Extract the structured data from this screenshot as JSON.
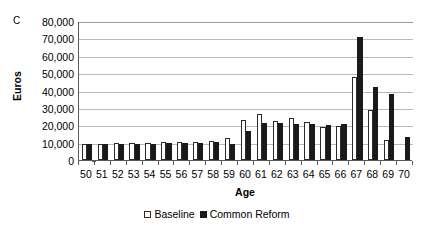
{
  "panel": {
    "letter": "C"
  },
  "legend": {
    "position": "bottom-center",
    "items": [
      {
        "label": "Baseline",
        "swatch": "open-square",
        "color": "#ffffff"
      },
      {
        "label": "Common Reform",
        "swatch": "filled-square",
        "color": "#1a1a1a"
      }
    ]
  },
  "chart_data": {
    "type": "bar",
    "title": "",
    "subtitle": "",
    "xlabel": "Age",
    "ylabel": "Euros",
    "ylim": [
      0,
      80000
    ],
    "ytick_labels": [
      "80,000",
      "70,000",
      "60,000",
      "50,000",
      "40,000",
      "30,000",
      "20,000",
      "10,000",
      "0"
    ],
    "ytick_values": [
      80000,
      70000,
      60000,
      50000,
      40000,
      30000,
      20000,
      10000,
      0
    ],
    "grid": "horizontal",
    "categories": [
      "50",
      "51",
      "52",
      "53",
      "54",
      "55",
      "56",
      "57",
      "58",
      "59",
      "60",
      "61",
      "62",
      "63",
      "64",
      "65",
      "66",
      "67",
      "68",
      "69",
      "70"
    ],
    "series": [
      {
        "name": "Baseline",
        "color": "#ffffff",
        "values": [
          9500,
          9500,
          9700,
          9800,
          10000,
          10200,
          10400,
          10600,
          11000,
          12500,
          23000,
          26500,
          22500,
          24000,
          22000,
          19000,
          19500,
          48000,
          29000,
          11500,
          0
        ]
      },
      {
        "name": "Common Reform",
        "color": "#1a1a1a",
        "values": [
          9000,
          9000,
          9200,
          9300,
          9500,
          9700,
          9800,
          10000,
          10200,
          9000,
          16500,
          21500,
          21500,
          21000,
          20500,
          20000,
          20500,
          71000,
          42000,
          38000,
          13000
        ]
      }
    ]
  }
}
